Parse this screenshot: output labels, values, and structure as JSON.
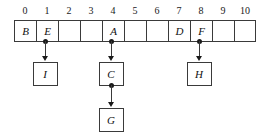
{
  "diagram": {
    "type": "array-with-children",
    "array": {
      "indices": [
        "0",
        "1",
        "2",
        "3",
        "4",
        "5",
        "6",
        "7",
        "8",
        "9",
        "10"
      ],
      "cells": [
        {
          "index": "0",
          "value": "B"
        },
        {
          "index": "1",
          "value": "E"
        },
        {
          "index": "2",
          "value": ""
        },
        {
          "index": "3",
          "value": ""
        },
        {
          "index": "4",
          "value": "A"
        },
        {
          "index": "5",
          "value": ""
        },
        {
          "index": "6",
          "value": ""
        },
        {
          "index": "7",
          "value": "D"
        },
        {
          "index": "8",
          "value": "F"
        },
        {
          "index": "9",
          "value": ""
        },
        {
          "index": "10",
          "value": ""
        }
      ]
    },
    "nodes": [
      {
        "id": "I",
        "label": "I",
        "parent_index": "1"
      },
      {
        "id": "C",
        "label": "C",
        "parent_index": "4"
      },
      {
        "id": "G",
        "label": "G",
        "parent_index": "C"
      },
      {
        "id": "H",
        "label": "H",
        "parent_index": "8"
      }
    ],
    "edges": [
      {
        "from": "1",
        "to": "I"
      },
      {
        "from": "4",
        "to": "C"
      },
      {
        "from": "C",
        "to": "G"
      },
      {
        "from": "8",
        "to": "H"
      }
    ],
    "colors": {
      "stroke": "#3a3a3a",
      "text": "#111111",
      "background": "#ffffff",
      "marker": "#1a1a1a"
    }
  }
}
